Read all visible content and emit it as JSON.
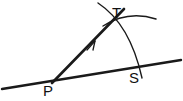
{
  "figure": {
    "type": "geometry-diagram",
    "background_color": "#ffffff",
    "stroke_color": "#1a1a1a",
    "width": 183,
    "height": 101
  },
  "labels": {
    "vertex_p": "P",
    "vertex_t": "T",
    "vertex_s": "S"
  },
  "label_positions": {
    "vertex_p": {
      "x": 43,
      "y": 96
    },
    "vertex_t": {
      "x": 112,
      "y": 18
    },
    "vertex_s": {
      "x": 129,
      "y": 83
    }
  },
  "points": {
    "p": {
      "x": 52,
      "y": 83
    },
    "t": {
      "x": 113,
      "y": 20
    },
    "s": {
      "x": 139,
      "y": 66
    }
  },
  "elements": {
    "base_line": {
      "name": "base-line-through-p-and-s",
      "x1": 2,
      "y1": 89,
      "x2": 181,
      "y2": 60
    },
    "ray_pt": {
      "name": "ray-from-p-through-t",
      "x1": 52,
      "y1": 83,
      "x2": 124,
      "y2": 9
    },
    "ray_arrow": {
      "name": "direction-arrowhead",
      "x": 92,
      "y": 44
    },
    "major_arc": {
      "name": "compass-arc-t-to-s",
      "path": "M 98 3 Q 130 24 142 78"
    },
    "minor_arc": {
      "name": "construction-arc-near-t",
      "path": "M 103 26 Q 128 10 156 19"
    }
  }
}
